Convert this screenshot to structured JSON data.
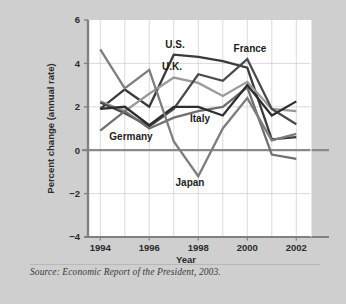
{
  "figure": {
    "background_color": "#cfcfcf",
    "plot_background_color": "#ffffff",
    "grid_color": "#c8c8d8",
    "axis_color": "#808080",
    "zero_line_color": "#8a8a8a",
    "source_note": "Source: Economic Report of the President, 2003."
  },
  "chart_data": {
    "type": "line",
    "title": "",
    "xlabel": "Year",
    "ylabel": "Percent change (annual rate)",
    "x": [
      1994,
      1995,
      1996,
      1997,
      1998,
      1999,
      2000,
      2001,
      2002
    ],
    "xlim": [
      1993.5,
      2002.6
    ],
    "ylim": [
      -4,
      6
    ],
    "yticks": [
      -4,
      -2,
      0,
      2,
      4,
      6
    ],
    "xticks": [
      1994,
      1996,
      1998,
      2000,
      2002
    ],
    "ytick_labels": [
      "−4",
      "−2",
      "0",
      "2",
      "4",
      "6"
    ],
    "xtick_labels": [
      "1994",
      "1996",
      "1998",
      "2000",
      "2002"
    ],
    "grid": true,
    "legend": "inline-annotations",
    "series": [
      {
        "name": "U.S.",
        "color": "#3a3a3a",
        "width": 2.3,
        "values": [
          1.9,
          2.8,
          2.0,
          4.4,
          4.3,
          4.1,
          3.8,
          0.5,
          0.6
        ]
      },
      {
        "name": "U.K.",
        "color": "#9a9a9a",
        "width": 2.3,
        "values": [
          2.25,
          1.8,
          2.6,
          3.35,
          3.1,
          2.5,
          3.15,
          1.9,
          1.8
        ]
      },
      {
        "name": "France",
        "color": "#4a4a4a",
        "width": 2.3,
        "values": [
          2.2,
          1.7,
          1.1,
          1.9,
          3.5,
          3.2,
          4.2,
          1.9,
          1.2
        ]
      },
      {
        "name": "Germany",
        "color": "#6f6f6f",
        "width": 2.3,
        "values": [
          0.9,
          1.8,
          1.0,
          1.5,
          1.8,
          2.0,
          2.9,
          -0.2,
          -0.4
        ]
      },
      {
        "name": "Italy",
        "color": "#2e2e2e",
        "width": 2.3,
        "values": [
          1.9,
          2.0,
          1.15,
          2.0,
          2.0,
          1.6,
          3.0,
          1.6,
          2.25
        ]
      },
      {
        "name": "Japan",
        "color": "#7d7d7d",
        "width": 2.3,
        "values": [
          4.65,
          2.85,
          3.7,
          0.4,
          -1.2,
          1.0,
          2.4,
          0.45,
          0.75
        ]
      }
    ],
    "annotations": [
      {
        "label": "U.S.",
        "x_px": 175,
        "y_px": 48
      },
      {
        "label": "France",
        "x_px": 250,
        "y_px": 52
      },
      {
        "label": "U.K.",
        "x_px": 172,
        "y_px": 70
      },
      {
        "label": "Italy",
        "x_px": 200,
        "y_px": 122
      },
      {
        "label": "Germany",
        "x_px": 131,
        "y_px": 140
      },
      {
        "label": "Japan",
        "x_px": 190,
        "y_px": 186
      }
    ]
  }
}
